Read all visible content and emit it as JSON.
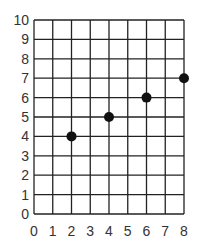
{
  "chart_data": {
    "type": "scatter",
    "title": "",
    "xlabel": "",
    "ylabel": "",
    "xlim": [
      0,
      8
    ],
    "ylim": [
      0,
      10
    ],
    "grid": true,
    "x_ticks": [
      "0",
      "1",
      "2",
      "3",
      "4",
      "5",
      "6",
      "7",
      "8"
    ],
    "y_ticks": [
      "0",
      "1",
      "2",
      "3",
      "4",
      "5",
      "6",
      "7",
      "8",
      "9",
      "10"
    ],
    "series": [
      {
        "name": "points",
        "x": [
          2,
          4,
          6,
          8
        ],
        "y": [
          4,
          5,
          6,
          7
        ]
      }
    ],
    "colors": {
      "grid": "#222222",
      "marker": "#111111",
      "text": "#333333"
    }
  }
}
